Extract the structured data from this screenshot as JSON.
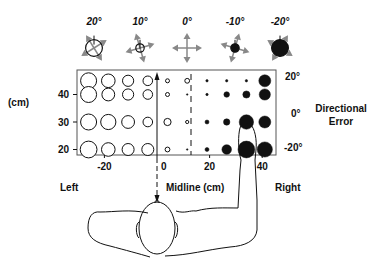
{
  "legend": {
    "items": [
      {
        "label": "20°",
        "error_deg": 20
      },
      {
        "label": "10°",
        "error_deg": 10
      },
      {
        "label": "0°",
        "error_deg": 0
      },
      {
        "label": "-10°",
        "error_deg": -10
      },
      {
        "label": "-20°",
        "error_deg": -20
      }
    ],
    "note": "open circle = positive error, filled circle = negative error, circle size = magnitude"
  },
  "axes": {
    "y_unit_label": "(cm)",
    "y_ticks": [
      "40",
      "30",
      "20"
    ],
    "y_tick_values": [
      40,
      30,
      20
    ],
    "x_ticks": [
      "-20",
      "0",
      "20",
      "40"
    ],
    "x_tick_values": [
      -20,
      0,
      20,
      40
    ],
    "x_range": [
      -30,
      45
    ],
    "y_range": [
      16,
      49
    ],
    "right_scale_labels": [
      "20°",
      "0°",
      "-20°"
    ],
    "right_title_line1": "Directional",
    "right_title_line2": "Error",
    "midline_label": "Midline (cm)",
    "left_label": "Left",
    "right_label": "Right",
    "dashed_line_x_cm": 13
  },
  "chart_data": {
    "type": "scatter",
    "title": "",
    "xlabel": "Midline (cm)",
    "ylabel": "(cm)",
    "x_columns_cm": [
      -26,
      -18.5,
      -11,
      -3.5,
      4,
      11.5,
      19,
      26.5,
      34,
      41
    ],
    "rows": [
      {
        "y_cm": 45,
        "errors_deg": [
          20,
          17,
          14,
          12,
          5,
          6,
          -3,
          -3,
          -3,
          -15
        ]
      },
      {
        "y_cm": 40,
        "errors_deg": [
          20,
          16,
          14,
          12,
          5,
          -1,
          -3,
          -7,
          -9,
          -14
        ]
      },
      {
        "y_cm": 30,
        "errors_deg": [
          20,
          19,
          16,
          12,
          9,
          4,
          -5,
          -8,
          -18,
          -15
        ]
      },
      {
        "y_cm": 20,
        "errors_deg": [
          21,
          17,
          15,
          15,
          6,
          -2,
          -5,
          -12,
          -21,
          -19
        ]
      }
    ],
    "size_encodes": "absolute directional error (degrees)",
    "fill_encodes": "sign (open = positive, filled = negative)",
    "grid": false
  }
}
